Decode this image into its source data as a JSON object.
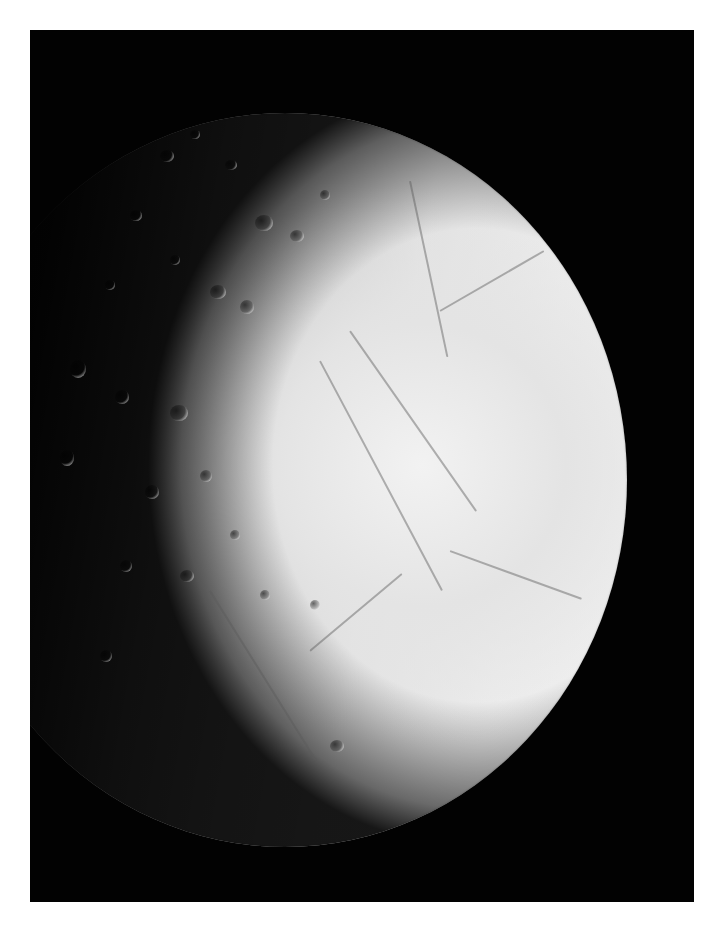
{
  "image": {
    "subject": "Cratered and fractured icy moon against black space",
    "description": "Grayscale photograph of a bright, icy moon; left side heavily cratered and shading into darkness at the terminator, right side smooth with long ridges and fractures, mounted on a white page with a black frame",
    "colors": {
      "page_background": "#ffffff",
      "space_background": "#020202",
      "surface_bright": "#f2f2f2",
      "surface_mid": "#c6c6c6",
      "terminator_dark": "#1a1a1a"
    }
  }
}
